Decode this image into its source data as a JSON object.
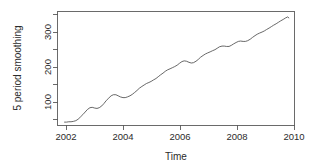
{
  "chart_data": {
    "type": "line",
    "title": "",
    "xlabel": "Time",
    "ylabel": "5 period smoothing",
    "xlim": [
      2001.8,
      2010.2
    ],
    "ylim": [
      40,
      355
    ],
    "grid": false,
    "legend": "none",
    "xticks": [
      2002,
      2004,
      2006,
      2008,
      2010
    ],
    "xtick_labels": [
      "2002",
      "2004",
      "2006",
      "2008",
      "2010"
    ],
    "yticks": [
      100,
      200,
      300
    ],
    "ytick_labels": [
      "100",
      "200",
      "300"
    ],
    "yticks_minor": [
      50,
      150,
      250,
      350
    ],
    "series": [
      {
        "name": "5 period smoothing",
        "x": [
          2002.05,
          2002.12,
          2002.2,
          2002.28,
          2002.36,
          2002.45,
          2002.53,
          2002.61,
          2002.7,
          2002.78,
          2002.86,
          2002.95,
          2003.03,
          2003.12,
          2003.2,
          2003.28,
          2003.37,
          2003.45,
          2003.53,
          2003.62,
          2003.7,
          2003.78,
          2003.87,
          2003.95,
          2004.03,
          2004.12,
          2004.2,
          2004.28,
          2004.37,
          2004.45,
          2004.53,
          2004.62,
          2004.7,
          2004.79,
          2004.87,
          2004.95,
          2005.04,
          2005.12,
          2005.2,
          2005.29,
          2005.37,
          2005.45,
          2005.54,
          2005.62,
          2005.7,
          2005.79,
          2005.87,
          2005.95,
          2006.04,
          2006.12,
          2006.21,
          2006.29,
          2006.37,
          2006.46,
          2006.54,
          2006.62,
          2006.71,
          2006.79,
          2006.87,
          2006.96,
          2007.04,
          2007.12,
          2007.21,
          2007.29,
          2007.38,
          2007.46,
          2007.54,
          2007.63,
          2007.71,
          2007.79,
          2007.88,
          2007.96,
          2008.04,
          2008.13,
          2008.21,
          2008.29,
          2008.38,
          2008.46,
          2008.54,
          2008.63,
          2008.71,
          2008.8,
          2008.88,
          2008.96,
          2009.05,
          2009.13,
          2009.21,
          2009.3,
          2009.38,
          2009.46,
          2009.55,
          2009.63,
          2009.71,
          2009.8,
          2009.88,
          2009.96,
          2010.0
        ],
        "y": [
          48,
          48,
          49,
          49,
          50,
          52,
          56,
          62,
          69,
          76,
          83,
          88,
          89,
          87,
          86,
          88,
          93,
          100,
          108,
          115,
          121,
          124,
          124,
          121,
          118,
          116,
          116,
          118,
          121,
          125,
          130,
          136,
          142,
          147,
          151,
          155,
          158,
          161,
          165,
          169,
          174,
          179,
          184,
          189,
          193,
          196,
          199,
          202,
          206,
          211,
          216,
          218,
          217,
          214,
          212,
          213,
          217,
          222,
          228,
          233,
          237,
          240,
          243,
          246,
          249,
          253,
          257,
          259,
          259,
          258,
          258,
          261,
          265,
          269,
          272,
          273,
          272,
          272,
          274,
          278,
          283,
          288,
          292,
          295,
          298,
          301,
          305,
          309,
          313,
          317,
          321,
          325,
          329,
          333,
          337,
          340,
          337
        ]
      }
    ]
  }
}
